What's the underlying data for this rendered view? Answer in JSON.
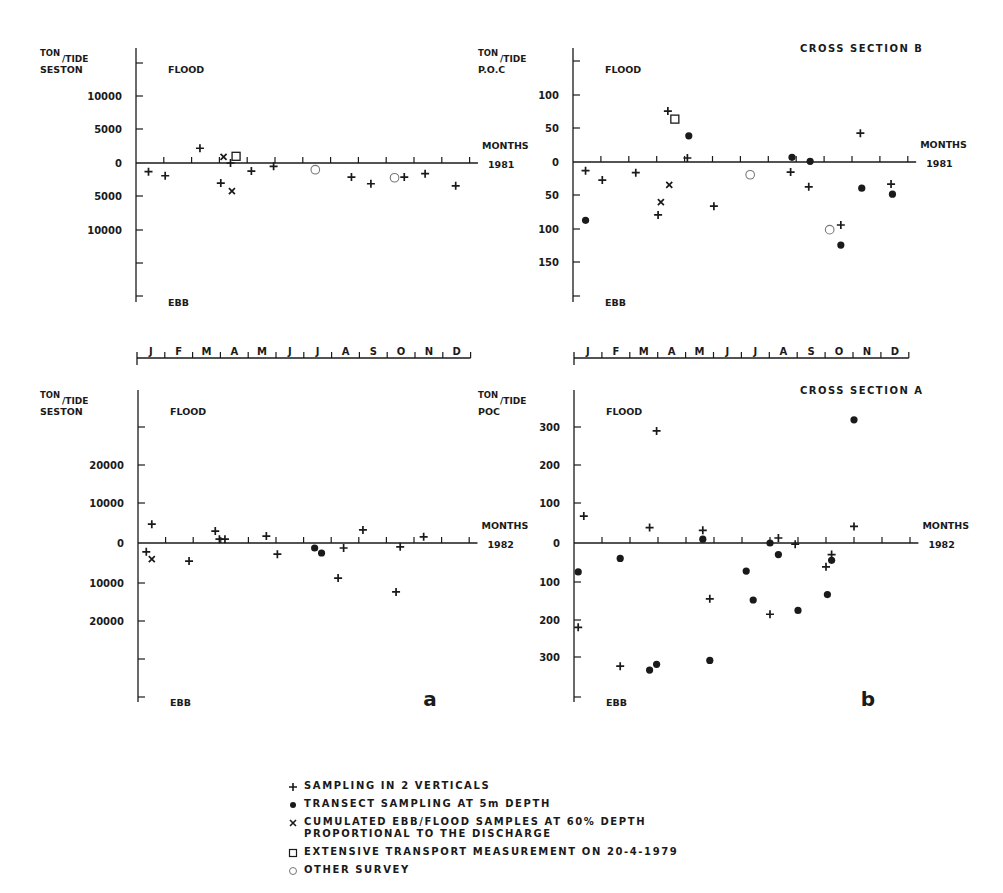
{
  "figure": {
    "panel_labels": [
      "a",
      "b"
    ],
    "month_axis_labels": [
      "J",
      "F",
      "M",
      "A",
      "M",
      "J",
      "J",
      "A",
      "S",
      "O",
      "N",
      "D"
    ],
    "common": {
      "y_unit": "TON/TIDE",
      "flood_label": "FLOOD",
      "ebb_label": "EBB",
      "x_label": "MONTHS"
    }
  },
  "legend": {
    "items": [
      {
        "marker": "plus",
        "symbol": "+",
        "text": "SAMPLING IN 2 VERTICALS"
      },
      {
        "marker": "dot",
        "symbol": "●",
        "text": "TRANSECT SAMPLING AT 5m DEPTH"
      },
      {
        "marker": "x",
        "symbol": "×",
        "text": "CUMULATED EBB/FLOOD SAMPLES AT 60% DEPTH\nPROPORTIONAL TO THE DISCHARGE"
      },
      {
        "marker": "square",
        "symbol": "□",
        "text": "EXTENSIVE TRANSPORT MEASUREMENT ON 20-4-1979"
      },
      {
        "marker": "circle",
        "symbol": "○",
        "text": "OTHER SURVEY"
      }
    ]
  },
  "chart_data": [
    {
      "id": "seston-1981",
      "type": "scatter",
      "title": "",
      "ylabel_top": "TON/TIDE",
      "ylabel": "SESTON",
      "xlabel": "MONTHS",
      "year": "1981",
      "flood_label": "FLOOD",
      "ebb_label": "EBB",
      "note": "Positive = flood, negative = ebb",
      "ytick_labels": [
        "10000",
        "5000",
        "0",
        "5000",
        "10000"
      ],
      "ytick_values": [
        10000,
        5000,
        0,
        -5000,
        -10000
      ],
      "ylim": [
        -20000,
        15000
      ],
      "x_unit": "month (1 = Jan, 13 = end Dec)",
      "xlim": [
        1,
        13
      ],
      "points": [
        {
          "m": 1.45,
          "v": -1300,
          "marker": "plus"
        },
        {
          "m": 2.05,
          "v": -1900,
          "marker": "plus"
        },
        {
          "m": 3.3,
          "v": 2200,
          "marker": "plus"
        },
        {
          "m": 4.05,
          "v": -3000,
          "marker": "plus"
        },
        {
          "m": 4.15,
          "v": 900,
          "marker": "x"
        },
        {
          "m": 4.4,
          "v": 0,
          "marker": "plus"
        },
        {
          "m": 4.45,
          "v": -4200,
          "marker": "x"
        },
        {
          "m": 4.6,
          "v": 1000,
          "marker": "square"
        },
        {
          "m": 5.15,
          "v": -1200,
          "marker": "plus"
        },
        {
          "m": 5.95,
          "v": -500,
          "marker": "plus"
        },
        {
          "m": 7.45,
          "v": -1000,
          "marker": "circle"
        },
        {
          "m": 8.75,
          "v": -2100,
          "marker": "plus"
        },
        {
          "m": 9.45,
          "v": -3100,
          "marker": "plus"
        },
        {
          "m": 10.3,
          "v": -2200,
          "marker": "circle"
        },
        {
          "m": 10.65,
          "v": -2100,
          "marker": "plus"
        },
        {
          "m": 11.4,
          "v": -1600,
          "marker": "plus"
        },
        {
          "m": 12.5,
          "v": -3400,
          "marker": "plus"
        }
      ]
    },
    {
      "id": "poc-b-1981",
      "type": "scatter",
      "title": "CROSS SECTION B",
      "ylabel_top": "TON/TIDE",
      "ylabel": "P.O.C",
      "xlabel": "MONTHS",
      "year": "1981",
      "flood_label": "FLOOD",
      "ebb_label": "EBB",
      "ytick_labels": [
        "100",
        "50",
        "0",
        "50",
        "100",
        "150"
      ],
      "ytick_values": [
        100,
        50,
        0,
        -50,
        -100,
        -150
      ],
      "ylim": [
        -200,
        150
      ],
      "xlim": [
        1,
        13
      ],
      "points": [
        {
          "m": 1.45,
          "v": -13,
          "marker": "plus"
        },
        {
          "m": 1.45,
          "v": -87,
          "marker": "dot"
        },
        {
          "m": 2.05,
          "v": -27,
          "marker": "plus"
        },
        {
          "m": 3.25,
          "v": -16,
          "marker": "plus"
        },
        {
          "m": 4.05,
          "v": -79,
          "marker": "plus"
        },
        {
          "m": 4.15,
          "v": -60,
          "marker": "x"
        },
        {
          "m": 4.4,
          "v": 76,
          "marker": "plus"
        },
        {
          "m": 4.45,
          "v": -34,
          "marker": "x"
        },
        {
          "m": 4.65,
          "v": 64,
          "marker": "square"
        },
        {
          "m": 5.1,
          "v": 6,
          "marker": "plus"
        },
        {
          "m": 5.15,
          "v": 39,
          "marker": "dot"
        },
        {
          "m": 6.05,
          "v": -66,
          "marker": "plus"
        },
        {
          "m": 7.35,
          "v": -19,
          "marker": "circle"
        },
        {
          "m": 8.8,
          "v": -15,
          "marker": "plus"
        },
        {
          "m": 8.85,
          "v": 7,
          "marker": "dot"
        },
        {
          "m": 9.5,
          "v": 1,
          "marker": "dot"
        },
        {
          "m": 9.45,
          "v": -37,
          "marker": "plus"
        },
        {
          "m": 10.2,
          "v": -101,
          "marker": "circle"
        },
        {
          "m": 10.6,
          "v": -94,
          "marker": "plus"
        },
        {
          "m": 10.6,
          "v": -124,
          "marker": "dot"
        },
        {
          "m": 11.3,
          "v": 43,
          "marker": "plus"
        },
        {
          "m": 11.35,
          "v": -39,
          "marker": "dot"
        },
        {
          "m": 12.4,
          "v": -33,
          "marker": "plus"
        },
        {
          "m": 12.45,
          "v": -48,
          "marker": "dot"
        }
      ]
    },
    {
      "id": "seston-1982",
      "type": "scatter",
      "title": "",
      "ylabel_top": "TON/TIDE",
      "ylabel": "SESTON",
      "xlabel": "MONTHS",
      "year": "1982",
      "flood_label": "FLOOD",
      "ebb_label": "EBB",
      "panel_letter": "a",
      "ytick_labels": [
        "20000",
        "10000",
        "0",
        "10000",
        "20000"
      ],
      "ytick_values": [
        20000,
        10000,
        0,
        -10000,
        -20000
      ],
      "ylim": [
        -40000,
        40000
      ],
      "xlim": [
        1,
        13
      ],
      "points": [
        {
          "m": 1.3,
          "v": -2300,
          "marker": "plus"
        },
        {
          "m": 1.5,
          "v": 4900,
          "marker": "plus"
        },
        {
          "m": 1.5,
          "v": -4200,
          "marker": "x"
        },
        {
          "m": 2.85,
          "v": -4700,
          "marker": "plus"
        },
        {
          "m": 3.8,
          "v": 3100,
          "marker": "plus"
        },
        {
          "m": 3.95,
          "v": 1000,
          "marker": "plus"
        },
        {
          "m": 4.15,
          "v": 1000,
          "marker": "plus"
        },
        {
          "m": 5.65,
          "v": 1800,
          "marker": "plus"
        },
        {
          "m": 6.05,
          "v": -2900,
          "marker": "plus"
        },
        {
          "m": 7.4,
          "v": -1300,
          "marker": "dot"
        },
        {
          "m": 7.65,
          "v": -2600,
          "marker": "dot"
        },
        {
          "m": 8.25,
          "v": -9100,
          "marker": "plus"
        },
        {
          "m": 8.45,
          "v": -1300,
          "marker": "plus"
        },
        {
          "m": 9.15,
          "v": 3400,
          "marker": "plus"
        },
        {
          "m": 10.35,
          "v": -12700,
          "marker": "plus"
        },
        {
          "m": 10.5,
          "v": -1000,
          "marker": "plus"
        },
        {
          "m": 11.35,
          "v": 1600,
          "marker": "plus"
        }
      ]
    },
    {
      "id": "poc-a-1982",
      "type": "scatter",
      "title": "CROSS SECTION A",
      "ylabel_top": "TON/TIDE",
      "ylabel": "POC",
      "xlabel": "MONTHS",
      "year": "1982",
      "flood_label": "FLOOD",
      "ebb_label": "EBB",
      "panel_letter": "b",
      "ytick_labels": [
        "300",
        "200",
        "100",
        "0",
        "100",
        "200",
        "300"
      ],
      "ytick_values": [
        300,
        200,
        100,
        0,
        -100,
        -200,
        -300
      ],
      "ylim": [
        -400,
        400
      ],
      "xlim": [
        1,
        13
      ],
      "points": [
        {
          "m": 1.15,
          "v": -219,
          "marker": "plus"
        },
        {
          "m": 1.15,
          "v": -75,
          "marker": "dot"
        },
        {
          "m": 1.35,
          "v": 70,
          "marker": "plus"
        },
        {
          "m": 2.65,
          "v": -320,
          "marker": "plus"
        },
        {
          "m": 2.65,
          "v": -40,
          "marker": "dot"
        },
        {
          "m": 3.7,
          "v": 40,
          "marker": "plus"
        },
        {
          "m": 3.7,
          "v": -330,
          "marker": "dot"
        },
        {
          "m": 3.95,
          "v": -315,
          "marker": "dot"
        },
        {
          "m": 3.95,
          "v": 291,
          "marker": "plus"
        },
        {
          "m": 5.6,
          "v": 33,
          "marker": "plus"
        },
        {
          "m": 5.6,
          "v": 10,
          "marker": "dot"
        },
        {
          "m": 5.85,
          "v": -145,
          "marker": "plus"
        },
        {
          "m": 5.85,
          "v": -305,
          "marker": "dot"
        },
        {
          "m": 7.15,
          "v": -73,
          "marker": "dot"
        },
        {
          "m": 7.4,
          "v": -148,
          "marker": "dot"
        },
        {
          "m": 8.0,
          "v": -185,
          "marker": "plus"
        },
        {
          "m": 8.0,
          "v": 0,
          "marker": "dot"
        },
        {
          "m": 8.3,
          "v": 13,
          "marker": "plus"
        },
        {
          "m": 8.3,
          "v": -30,
          "marker": "dot"
        },
        {
          "m": 8.9,
          "v": -3,
          "marker": "plus"
        },
        {
          "m": 9.0,
          "v": -175,
          "marker": "dot"
        },
        {
          "m": 10.0,
          "v": -62,
          "marker": "plus"
        },
        {
          "m": 10.05,
          "v": -134,
          "marker": "dot"
        },
        {
          "m": 10.2,
          "v": -30,
          "marker": "plus"
        },
        {
          "m": 10.2,
          "v": -45,
          "marker": "dot"
        },
        {
          "m": 11.0,
          "v": 320,
          "marker": "dot"
        },
        {
          "m": 11.0,
          "v": 43,
          "marker": "plus"
        }
      ]
    }
  ]
}
